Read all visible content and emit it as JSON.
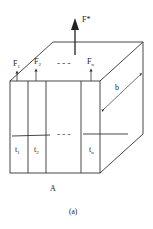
{
  "figure": {
    "caption": "(a)",
    "front_face_label": "A",
    "total_force_label": "F*",
    "width_label": "b",
    "dashes_top": "- - -",
    "dashes_mid": "- - -",
    "forces": [
      {
        "label": "F",
        "sub": "1"
      },
      {
        "label": "F",
        "sub": "2"
      },
      {
        "label": "F",
        "sub": "n"
      }
    ],
    "layers": [
      {
        "label": "t",
        "sub": "1"
      },
      {
        "label": "t",
        "sub": "2"
      },
      {
        "label": "t",
        "sub": "n"
      }
    ]
  },
  "colors": {
    "line": "#333333",
    "background": "#ffffff"
  }
}
